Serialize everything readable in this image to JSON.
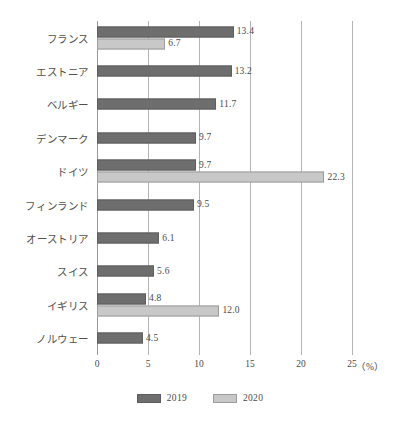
{
  "chart_data": {
    "type": "bar",
    "orientation": "horizontal",
    "title": "",
    "xlabel": "（%）",
    "ylabel": "",
    "xlim": [
      0,
      25
    ],
    "xticks": [
      0,
      5,
      10,
      15,
      20,
      25
    ],
    "xtick_labels": [
      "0",
      "5",
      "10",
      "15",
      "20",
      "25"
    ],
    "unit_label": "（%）",
    "grid": true,
    "grid_axis": "x",
    "legend_position": "bottom-center",
    "categories": [
      "フランス",
      "エストニア",
      "ベルギー",
      "デンマーク",
      "ドイツ",
      "フィンランド",
      "オーストリア",
      "スイス",
      "イギリス",
      "ノルウェー"
    ],
    "series": [
      {
        "name": "2019",
        "color": "#6e6e6e",
        "values": [
          13.4,
          13.2,
          11.7,
          9.7,
          9.7,
          9.5,
          6.1,
          5.6,
          4.8,
          4.5
        ],
        "labels": [
          "13.4",
          "13.2",
          "11.7",
          "9.7",
          "9.7",
          "9.5",
          "6.1",
          "5.6",
          "4.8",
          "4.5"
        ]
      },
      {
        "name": "2020",
        "color": "#c8c8c8",
        "values": [
          6.7,
          null,
          null,
          null,
          22.3,
          null,
          null,
          null,
          12.0,
          null
        ],
        "labels": [
          "6.7",
          null,
          null,
          null,
          "22.3",
          null,
          null,
          null,
          "12.0",
          null
        ]
      }
    ]
  },
  "legend": {
    "items": [
      {
        "label": "2019",
        "color": "#6e6e6e"
      },
      {
        "label": "2020",
        "color": "#c8c8c8"
      }
    ]
  },
  "axis": {
    "unit": "（%）"
  }
}
